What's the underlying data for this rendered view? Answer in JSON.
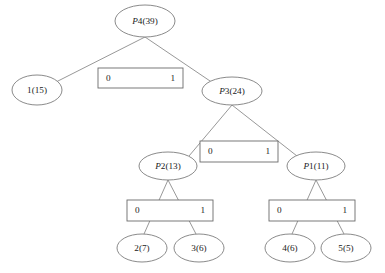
{
  "figure": {
    "kind": "huffman-tree",
    "background_color": "#ffffff",
    "line_color": "#7d7d7d",
    "text_color": "#1a1a1a"
  },
  "nodes": [
    {
      "id": "p4",
      "label": "P4(39)",
      "prefix": "P",
      "suffix": "4(39)",
      "type": "internal",
      "cx": 145,
      "cy": 21,
      "rx": 30,
      "ry": 16
    },
    {
      "id": "n1",
      "label": "1(15)",
      "prefix": "",
      "suffix": "1(15)",
      "type": "leaf",
      "cx": 37,
      "cy": 90,
      "rx": 25,
      "ry": 15
    },
    {
      "id": "p3",
      "label": "P3(24)",
      "prefix": "P",
      "suffix": "3(24)",
      "type": "internal",
      "cx": 232,
      "cy": 91,
      "rx": 30,
      "ry": 14
    },
    {
      "id": "p2",
      "label": "P2(13)",
      "prefix": "P",
      "suffix": "2(13)",
      "type": "internal",
      "cx": 168,
      "cy": 166,
      "rx": 29,
      "ry": 14
    },
    {
      "id": "p1",
      "label": "P1(11)",
      "prefix": "P",
      "suffix": "1(11)",
      "type": "internal",
      "cx": 316,
      "cy": 166,
      "rx": 29,
      "ry": 14
    },
    {
      "id": "n2",
      "label": "2(7)",
      "prefix": "",
      "suffix": "2(7)",
      "type": "leaf",
      "cx": 142,
      "cy": 248,
      "rx": 25,
      "ry": 14
    },
    {
      "id": "n3",
      "label": "3(6)",
      "prefix": "",
      "suffix": "3(6)",
      "type": "leaf",
      "cx": 199,
      "cy": 248,
      "rx": 25,
      "ry": 14
    },
    {
      "id": "n4",
      "label": "4(6)",
      "prefix": "",
      "suffix": "4(6)",
      "type": "leaf",
      "cx": 290,
      "cy": 248,
      "rx": 25,
      "ry": 14
    },
    {
      "id": "n5",
      "label": "5(5)",
      "prefix": "",
      "suffix": "5(5)",
      "type": "leaf",
      "cx": 346,
      "cy": 248,
      "rx": 25,
      "ry": 14
    }
  ],
  "decision_boxes": [
    {
      "id": "box-p4",
      "parent": "p4",
      "left_bit": "0",
      "right_bit": "1",
      "x": 98,
      "y": 68,
      "w": 85,
      "h": 20
    },
    {
      "id": "box-p3",
      "parent": "p3",
      "left_bit": "0",
      "right_bit": "1",
      "x": 200,
      "y": 141,
      "w": 78,
      "h": 21
    },
    {
      "id": "box-p2",
      "parent": "p2",
      "left_bit": "0",
      "right_bit": "1",
      "x": 127,
      "y": 200,
      "w": 86,
      "h": 21
    },
    {
      "id": "box-p1",
      "parent": "p1",
      "left_bit": "0",
      "right_bit": "1",
      "x": 269,
      "y": 200,
      "w": 86,
      "h": 21
    }
  ],
  "edges": [
    {
      "id": "e-p4-n1",
      "from": "p4",
      "to": "n1",
      "bit": "0",
      "x1": 145,
      "y1": 37,
      "x2": 56,
      "y2": 82
    },
    {
      "id": "e-p4-p3",
      "from": "p4",
      "to": "p3",
      "bit": "1",
      "x1": 145,
      "y1": 37,
      "x2": 213,
      "y2": 83
    },
    {
      "id": "e-p3-p2",
      "from": "p3",
      "to": "p2",
      "bit": "0",
      "x1": 232,
      "y1": 105,
      "x2": 189,
      "y2": 156
    },
    {
      "id": "e-p3-p1",
      "from": "p3",
      "to": "p1",
      "bit": "1",
      "x1": 232,
      "y1": 105,
      "x2": 297,
      "y2": 156
    },
    {
      "id": "e-p2-n2",
      "from": "p2",
      "to": "n2",
      "bit": "0",
      "x1": 168,
      "y1": 180,
      "x2": 144,
      "y2": 234
    },
    {
      "id": "e-p2-n3",
      "from": "p2",
      "to": "n3",
      "bit": "1",
      "x1": 168,
      "y1": 180,
      "x2": 196,
      "y2": 234
    },
    {
      "id": "e-p1-n4",
      "from": "p1",
      "to": "n4",
      "bit": "0",
      "x1": 316,
      "y1": 180,
      "x2": 292,
      "y2": 234
    },
    {
      "id": "e-p1-n5",
      "from": "p1",
      "to": "n5",
      "bit": "1",
      "x1": 316,
      "y1": 180,
      "x2": 344,
      "y2": 234
    }
  ],
  "chart_data": {
    "type": "diagram",
    "title": "",
    "tree": {
      "root": "P4(39)",
      "structure": [
        {
          "parent": "P4(39)",
          "weight": 39,
          "left_bit": "0",
          "left_child": "1(15)",
          "right_bit": "1",
          "right_child": "P3(24)"
        },
        {
          "parent": "P3(24)",
          "weight": 24,
          "left_bit": "0",
          "left_child": "P2(13)",
          "right_bit": "1",
          "right_child": "P1(11)"
        },
        {
          "parent": "P2(13)",
          "weight": 13,
          "left_bit": "0",
          "left_child": "2(7)",
          "right_bit": "1",
          "right_child": "3(6)"
        },
        {
          "parent": "P1(11)",
          "weight": 11,
          "left_bit": "0",
          "left_child": "4(6)",
          "right_bit": "1",
          "right_child": "5(5)"
        }
      ],
      "leaves": [
        {
          "symbol": "1",
          "weight": 15,
          "code": "0"
        },
        {
          "symbol": "2",
          "weight": 7,
          "code": "100"
        },
        {
          "symbol": "3",
          "weight": 6,
          "code": "101"
        },
        {
          "symbol": "4",
          "weight": 6,
          "code": "110"
        },
        {
          "symbol": "5",
          "weight": 5,
          "code": "111"
        }
      ]
    }
  }
}
